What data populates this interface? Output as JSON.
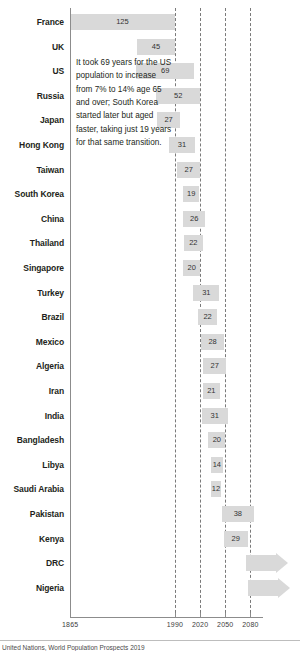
{
  "chart_data": {
    "type": "bar",
    "title": "",
    "subtitle": "",
    "xlabel": "",
    "ylabel": "",
    "orientation": "horizontal",
    "grid": true,
    "legend": false,
    "xlim": [
      1865,
      2095
    ],
    "axis_ticks": [
      "1865",
      "1990",
      "2020",
      "2050",
      "2080"
    ],
    "axis_tick_years": [
      1865,
      1990,
      2020,
      2050,
      2080
    ],
    "value_note": "Bar length = number of years for population aged 65+ to rise from 7% to 14%; bar position = period over which the transition occurs",
    "categories": [
      "France",
      "UK",
      "US",
      "Russia",
      "Japan",
      "Hong Kong",
      "Taiwan",
      "South Korea",
      "China",
      "Thailand",
      "Singapore",
      "Turkey",
      "Brazil",
      "Mexico",
      "Algeria",
      "Iran",
      "India",
      "Bangladesh",
      "Libya",
      "Saudi Arabia",
      "Pakistan",
      "Kenya",
      "DRC",
      "Nigeria"
    ],
    "values": [
      125,
      45,
      69,
      52,
      27,
      31,
      27,
      19,
      26,
      22,
      20,
      31,
      22,
      28,
      27,
      21,
      31,
      20,
      14,
      12,
      38,
      29,
      null,
      null
    ],
    "bars": [
      {
        "label": "France",
        "value": 125,
        "value_text": "125",
        "start_year": 1865,
        "end_year": 1990,
        "open_ended": false
      },
      {
        "label": "UK",
        "value": 45,
        "value_text": "45",
        "start_year": 1945,
        "end_year": 1990,
        "open_ended": false
      },
      {
        "label": "US",
        "value": 69,
        "value_text": "69",
        "start_year": 1944,
        "end_year": 2013,
        "open_ended": false
      },
      {
        "label": "Russia",
        "value": 52,
        "value_text": "52",
        "start_year": 1968,
        "end_year": 2020,
        "open_ended": false
      },
      {
        "label": "Japan",
        "value": 27,
        "value_text": "27",
        "start_year": 1969,
        "end_year": 1996,
        "open_ended": false
      },
      {
        "label": "Hong Kong",
        "value": 31,
        "value_text": "31",
        "start_year": 1983,
        "end_year": 2014,
        "open_ended": false
      },
      {
        "label": "Taiwan",
        "value": 27,
        "value_text": "27",
        "start_year": 1993,
        "end_year": 2020,
        "open_ended": false
      },
      {
        "label": "South Korea",
        "value": 19,
        "value_text": "19",
        "start_year": 2000,
        "end_year": 2019,
        "open_ended": false
      },
      {
        "label": "China",
        "value": 26,
        "value_text": "26",
        "start_year": 2000,
        "end_year": 2026,
        "open_ended": false
      },
      {
        "label": "Thailand",
        "value": 22,
        "value_text": "22",
        "start_year": 2001,
        "end_year": 2023,
        "open_ended": false
      },
      {
        "label": "Singapore",
        "value": 20,
        "value_text": "20",
        "start_year": 2000,
        "end_year": 2020,
        "open_ended": false
      },
      {
        "label": "Turkey",
        "value": 31,
        "value_text": "31",
        "start_year": 2012,
        "end_year": 2043,
        "open_ended": false
      },
      {
        "label": "Brazil",
        "value": 22,
        "value_text": "22",
        "start_year": 2018,
        "end_year": 2040,
        "open_ended": false
      },
      {
        "label": "Mexico",
        "value": 28,
        "value_text": "28",
        "start_year": 2021,
        "end_year": 2049,
        "open_ended": false
      },
      {
        "label": "Algeria",
        "value": 27,
        "value_text": "27",
        "start_year": 2024,
        "end_year": 2051,
        "open_ended": false
      },
      {
        "label": "Iran",
        "value": 21,
        "value_text": "21",
        "start_year": 2023,
        "end_year": 2044,
        "open_ended": false
      },
      {
        "label": "India",
        "value": 31,
        "value_text": "31",
        "start_year": 2022,
        "end_year": 2053,
        "open_ended": false
      },
      {
        "label": "Bangladesh",
        "value": 20,
        "value_text": "20",
        "start_year": 2030,
        "end_year": 2050,
        "open_ended": false
      },
      {
        "label": "Libya",
        "value": 14,
        "value_text": "14",
        "start_year": 2033,
        "end_year": 2047,
        "open_ended": false
      },
      {
        "label": "Saudi Arabia",
        "value": 12,
        "value_text": "12",
        "start_year": 2033,
        "end_year": 2045,
        "open_ended": false
      },
      {
        "label": "Pakistan",
        "value": 38,
        "value_text": "38",
        "start_year": 2046,
        "end_year": 2084,
        "open_ended": false
      },
      {
        "label": "Kenya",
        "value": 29,
        "value_text": "29",
        "start_year": 2048,
        "end_year": 2077,
        "open_ended": false
      },
      {
        "label": "DRC",
        "value": null,
        "value_text": "",
        "start_year": 2075,
        "end_year": null,
        "open_ended": true
      },
      {
        "label": "Nigeria",
        "value": null,
        "value_text": "",
        "start_year": 2077,
        "end_year": null,
        "open_ended": true
      }
    ]
  },
  "annotation": {
    "text": "It took 69 years for the US population to increase from 7% to 14% age 65 and over; South Korea started later but aged faster, taking just 19 years for that same transition."
  },
  "footer": {
    "source": "United Nations, World Population Prospects 2019"
  },
  "colors": {
    "bar": "#d9d9d9",
    "axis": "#8c8c8c",
    "gridline": "#7a7a7a",
    "text": "#231f20",
    "background": "#ffffff"
  }
}
